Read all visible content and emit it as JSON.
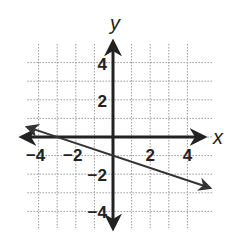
{
  "chart_data": {
    "type": "line",
    "title": "",
    "xlabel": "x",
    "ylabel": "y",
    "xlim": [
      -4.5,
      5
    ],
    "ylim": [
      -4.5,
      5
    ],
    "grid": true,
    "grid_style": "dotted",
    "x_ticks": [
      -4,
      -2,
      2,
      4
    ],
    "y_ticks": [
      4,
      2,
      -2,
      -4
    ],
    "x_tick_labels": [
      "−4",
      "−2",
      "2",
      "4"
    ],
    "y_tick_labels": [
      "4",
      "2",
      "−2",
      "−4"
    ],
    "series": [
      {
        "name": "line",
        "equation": "y = -x/3 - 1",
        "slope": -0.3333,
        "y_intercept": -1,
        "x_intercept": -3,
        "x": [
          -4.6,
          5.2
        ],
        "y": [
          0.53,
          -2.73
        ],
        "arrows": "both"
      }
    ],
    "legend": null
  },
  "colors": {
    "axis": "#222222",
    "grid": "#999999",
    "line": "#333333",
    "background": "#ffffff"
  }
}
